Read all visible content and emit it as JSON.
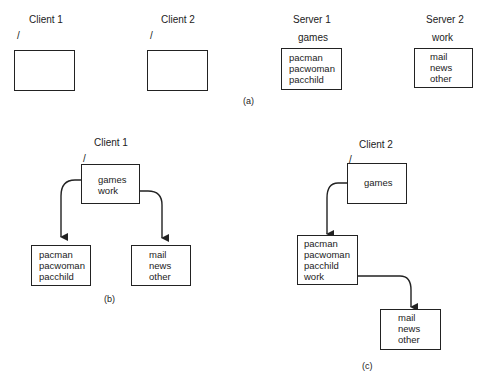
{
  "page_number": "",
  "part_a": {
    "label": "(a)",
    "client1": {
      "title": "Client 1",
      "root": "/"
    },
    "client2": {
      "title": "Client 2",
      "root": "/"
    },
    "server1": {
      "title": "Server 1",
      "dir": "games",
      "entries": [
        "pacman",
        "pacwoman",
        "pacchild"
      ]
    },
    "server2": {
      "title": "Server 2",
      "dir": "work",
      "entries": [
        "mail",
        "news",
        "other"
      ]
    }
  },
  "part_b": {
    "label": "(b)",
    "title": "Client 1",
    "root": "/",
    "root_entries": [
      "games",
      "work"
    ],
    "games_entries": [
      "pacman",
      "pacwoman",
      "pacchild"
    ],
    "work_entries": [
      "mail",
      "news",
      "other"
    ]
  },
  "part_c": {
    "label": "(c)",
    "title": "Client 2",
    "root": "/",
    "root_entries": [
      "games"
    ],
    "games_entries": [
      "pacman",
      "pacwoman",
      "pacchild",
      "work"
    ],
    "work_entries": [
      "mail",
      "news",
      "other"
    ]
  }
}
